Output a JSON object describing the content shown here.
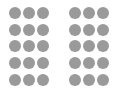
{
  "colors": {
    "background": "#ffffff",
    "dot": "#9a9a9a"
  },
  "groups": [
    {
      "name": "left-dot-grid",
      "columns": 3,
      "rows": 5,
      "count": 15
    },
    {
      "name": "right-dot-grid",
      "columns": 3,
      "rows": 5,
      "count": 15
    }
  ]
}
